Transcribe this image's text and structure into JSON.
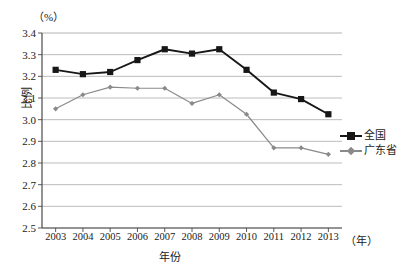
{
  "chart_data": {
    "type": "line",
    "title": "",
    "subtitle": "",
    "xlabel": "年份",
    "ylabel": "比例",
    "x_unit": "（年）",
    "y_unit": "（%）",
    "categories": [
      "2003",
      "2004",
      "2005",
      "2006",
      "2007",
      "2008",
      "2009",
      "2010",
      "2011",
      "2012",
      "2013"
    ],
    "ylim": [
      2.5,
      3.4
    ],
    "ytick_labels": [
      "3.4",
      "3.3",
      "3.2",
      "3.1",
      "3.0",
      "2.9",
      "2.8",
      "2.7",
      "2.6",
      "2.5"
    ],
    "ytick_values": [
      3.4,
      3.3,
      3.2,
      3.1,
      3.0,
      2.9,
      2.8,
      2.7,
      2.6,
      2.5
    ],
    "grid": true,
    "legend_position": "right",
    "series": [
      {
        "name": "全国",
        "color": "#171717",
        "marker": "square",
        "values": [
          3.23,
          3.21,
          3.22,
          3.275,
          3.325,
          3.305,
          3.325,
          3.23,
          3.125,
          3.095,
          3.025
        ]
      },
      {
        "name": "广东省",
        "color": "#8a8a8a",
        "marker": "diamond",
        "values": [
          3.05,
          3.115,
          3.15,
          3.145,
          3.145,
          3.075,
          3.115,
          3.025,
          2.87,
          2.87,
          2.84
        ]
      }
    ]
  },
  "axes": {
    "y_unit_label": "（%）",
    "y_title": "比例",
    "x_title": "年份",
    "x_unit_label": "（年）"
  },
  "legend": {
    "items": [
      {
        "label": "全国"
      },
      {
        "label": "广东省"
      }
    ]
  },
  "colors": {
    "national": "#171717",
    "guangdong": "#8a8a8a",
    "grid": "#b4b4b4",
    "axis": "#4a4a4a",
    "background": "#ffffff"
  }
}
